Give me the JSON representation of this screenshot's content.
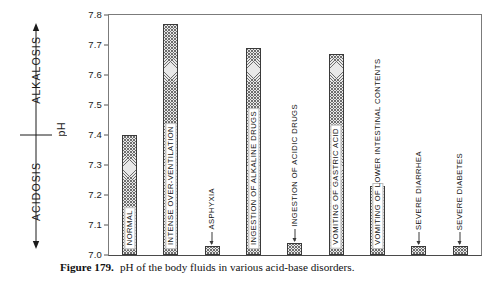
{
  "figure": {
    "caption_label": "Figure 179.",
    "caption_text": "pH of the body fluids in various acid-base disorders."
  },
  "axis_annotation": {
    "alkalosis_label": "ALKALOSIS",
    "acidosis_label": "ACIDOSIS",
    "ph_label": "pH"
  },
  "chart_data": {
    "type": "bar",
    "title": "pH of the body fluids in various acid-base disorders.",
    "xlabel": "",
    "ylabel": "pH",
    "ylim": [
      7.0,
      7.8
    ],
    "yticks": [
      "7.0",
      "7.1",
      "7.2",
      "7.3",
      "7.4",
      "7.5",
      "7.6",
      "7.7",
      "7.8"
    ],
    "ytick_values": [
      7.0,
      7.1,
      7.2,
      7.3,
      7.4,
      7.5,
      7.6,
      7.7,
      7.8
    ],
    "grid": false,
    "legend": "none",
    "bar_fill": "#e9e9e9",
    "bar_hatch_color": "#6e6e6e",
    "bar_edge": "#3a3a3a",
    "categories": [
      "NORMAL",
      "INTENSE OVER-VENTILATION",
      "ASPHYXIA",
      "INGESTION OF ALKALINE DRUGS",
      "INGESTION OF ACIDIC DRUGS",
      "VOMITING OF GASTRIC ACID",
      "VOMITING OF LOWER INTESTINAL CONTENTS",
      "SEVERE DIARRHEA",
      "SEVERE DIABETES"
    ],
    "values": [
      7.4,
      7.77,
      7.03,
      7.69,
      7.04,
      7.67,
      7.23,
      7.03,
      7.03
    ],
    "label_placement": [
      "inside",
      "inside",
      "outside",
      "inside",
      "outside",
      "inside",
      "inside",
      "outside",
      "outside"
    ]
  }
}
